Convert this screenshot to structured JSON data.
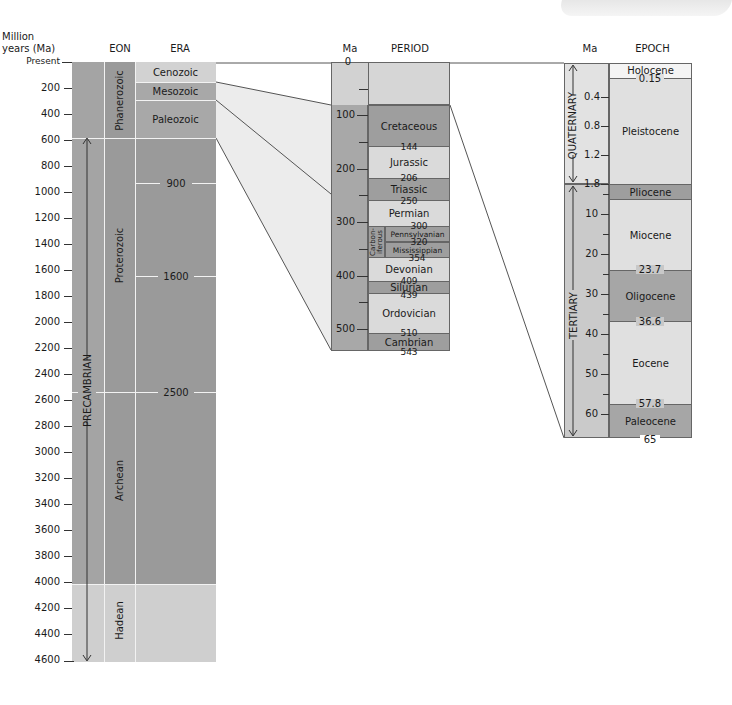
{
  "headers": {
    "million_years": "Million\nyears (Ma)",
    "million_years_line1": "Million",
    "million_years_line2": "years (Ma)",
    "eon": "EON",
    "era": "ERA",
    "period_ma": "Ma",
    "period": "PERIOD",
    "epoch_ma": "Ma",
    "epoch": "EPOCH"
  },
  "main_axis": {
    "ticks": [
      "Present",
      "200",
      "400",
      "600",
      "800",
      "1000",
      "1200",
      "1400",
      "1600",
      "1800",
      "2000",
      "2200",
      "2400",
      "2600",
      "2800",
      "3000",
      "3200",
      "3400",
      "3600",
      "3800",
      "4000",
      "4200",
      "4400",
      "4600"
    ]
  },
  "supereon": {
    "label": "PRECAMBRIAN"
  },
  "eons": [
    {
      "label": "Phanerozoic",
      "start": 0,
      "end": 543
    },
    {
      "label": "Proterozoic",
      "start": 543,
      "end": 2500
    },
    {
      "label": "Archean",
      "start": 2500,
      "end": 4000
    },
    {
      "label": "Hadean",
      "start": 4000,
      "end": 4600
    }
  ],
  "eras": [
    {
      "label": "Cenozoic",
      "start": 0,
      "end": 65
    },
    {
      "label": "Mesozoic",
      "start": 65,
      "end": 250
    },
    {
      "label": "Paleozoic",
      "start": 250,
      "end": 543
    }
  ],
  "era_boundary_labels": [
    "900",
    "1600",
    "2500"
  ],
  "period_axis": {
    "ticks": [
      "0",
      "100",
      "200",
      "300",
      "400",
      "500"
    ]
  },
  "periods": [
    {
      "label": "Cretaceous",
      "start": 65,
      "end": 144
    },
    {
      "label": "Jurassic",
      "start": 144,
      "end": 206
    },
    {
      "label": "Triassic",
      "start": 206,
      "end": 250
    },
    {
      "label": "Permian",
      "start": 250,
      "end": 300
    },
    {
      "label": "Pennsylvanian",
      "start": 300,
      "end": 320
    },
    {
      "label": "Mississippian",
      "start": 320,
      "end": 354
    },
    {
      "label": "Devonian",
      "start": 354,
      "end": 409
    },
    {
      "label": "Silurian",
      "start": 409,
      "end": 439
    },
    {
      "label": "Ordovician",
      "start": 439,
      "end": 510
    },
    {
      "label": "Cambrian",
      "start": 510,
      "end": 543
    }
  ],
  "carboniferous": {
    "line1": "Carbon-",
    "line2": "iferous"
  },
  "period_boundary_labels": [
    "144",
    "206",
    "250",
    "300",
    "320",
    "354",
    "409",
    "439",
    "510",
    "543"
  ],
  "epoch_axis": {
    "quaternary_ticks": [
      "0.4",
      "0.8",
      "1.2",
      "1.8"
    ],
    "tertiary_ticks": [
      "10",
      "20",
      "30",
      "40",
      "50",
      "60"
    ]
  },
  "sub_eras": [
    {
      "label": "QUATERNARY",
      "start": 0,
      "end": 1.8
    },
    {
      "label": "TERTIARY",
      "start": 1.8,
      "end": 65
    }
  ],
  "epochs": [
    {
      "label": "Holocene",
      "start": 0,
      "end": 0.15
    },
    {
      "label": "Pleistocene",
      "start": 0.15,
      "end": 1.8
    },
    {
      "label": "Pliocene",
      "start": 1.8,
      "end": 5.3
    },
    {
      "label": "Miocene",
      "start": 5.3,
      "end": 23.7
    },
    {
      "label": "Oligocene",
      "start": 23.7,
      "end": 36.6
    },
    {
      "label": "Eocene",
      "start": 36.6,
      "end": 57.8
    },
    {
      "label": "Paleocene",
      "start": 57.8,
      "end": 65
    }
  ],
  "epoch_boundary_labels": [
    "0.15",
    "23.7",
    "36.6",
    "57.8",
    "65"
  ],
  "colors": {
    "dark": "#9a9a9a",
    "medium": "#b3b3b3",
    "light": "#d4d4d4",
    "pale": "#e6e6e6",
    "connector_fill": "#ececec",
    "line": "#555555"
  }
}
